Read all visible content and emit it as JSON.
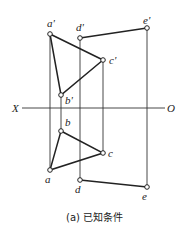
{
  "axis": {
    "left_label": "X",
    "right_label": "O"
  },
  "points": {
    "a_prime": "a'",
    "b_prime": "b'",
    "c_prime": "c'",
    "d_prime": "d'",
    "e_prime": "e'",
    "a": "a",
    "b": "b",
    "c": "c",
    "d": "d",
    "e": "e"
  },
  "caption": "(a) 已知条件"
}
